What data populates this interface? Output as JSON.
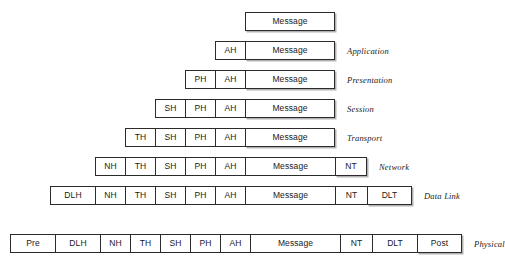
{
  "diagram": {
    "cell_labels": {
      "message": "Message",
      "ah": "AH",
      "ph": "PH",
      "sh": "SH",
      "th": "TH",
      "nh": "NH",
      "nt": "NT",
      "dlh": "DLH",
      "dlt": "DLT",
      "pre": "Pre",
      "post": "Post"
    },
    "rows": [
      {
        "layer_label": "",
        "top": 12,
        "left": 245,
        "cells": [
          {
            "text": "Message",
            "width": 90
          }
        ]
      },
      {
        "layer_label": "Application",
        "top": 41,
        "left": 215,
        "cells": [
          {
            "text": "AH",
            "width": 30
          },
          {
            "text": "Message",
            "width": 90
          }
        ]
      },
      {
        "layer_label": "Presentation",
        "top": 70,
        "left": 185,
        "cells": [
          {
            "text": "PH",
            "width": 30
          },
          {
            "text": "AH",
            "width": 30
          },
          {
            "text": "Message",
            "width": 90
          }
        ]
      },
      {
        "layer_label": "Session",
        "top": 99,
        "left": 155,
        "cells": [
          {
            "text": "SH",
            "width": 30
          },
          {
            "text": "PH",
            "width": 30
          },
          {
            "text": "AH",
            "width": 30
          },
          {
            "text": "Message",
            "width": 90
          }
        ]
      },
      {
        "layer_label": "Transport",
        "top": 128,
        "left": 125,
        "cells": [
          {
            "text": "TH",
            "width": 30
          },
          {
            "text": "SH",
            "width": 30
          },
          {
            "text": "PH",
            "width": 30
          },
          {
            "text": "AH",
            "width": 30
          },
          {
            "text": "Message",
            "width": 90
          }
        ]
      },
      {
        "layer_label": "Network",
        "top": 157,
        "left": 95,
        "cells": [
          {
            "text": "NH",
            "width": 30
          },
          {
            "text": "TH",
            "width": 30
          },
          {
            "text": "SH",
            "width": 30
          },
          {
            "text": "PH",
            "width": 30
          },
          {
            "text": "AH",
            "width": 30
          },
          {
            "text": "Message",
            "width": 90
          },
          {
            "text": "NT",
            "width": 32
          }
        ]
      },
      {
        "layer_label": "Data Link",
        "top": 186,
        "left": 50,
        "cells": [
          {
            "text": "DLH",
            "width": 45
          },
          {
            "text": "NH",
            "width": 30
          },
          {
            "text": "TH",
            "width": 30
          },
          {
            "text": "SH",
            "width": 30
          },
          {
            "text": "PH",
            "width": 30
          },
          {
            "text": "AH",
            "width": 30
          },
          {
            "text": "Message",
            "width": 90
          },
          {
            "text": "NT",
            "width": 32
          },
          {
            "text": "DLT",
            "width": 45
          }
        ]
      },
      {
        "layer_label": "Physical",
        "top": 234,
        "left": 10,
        "cells": [
          {
            "text": "Pre",
            "width": 45
          },
          {
            "text": "DLH",
            "width": 45
          },
          {
            "text": "NH",
            "width": 30
          },
          {
            "text": "TH",
            "width": 30
          },
          {
            "text": "SH",
            "width": 30
          },
          {
            "text": "PH",
            "width": 30
          },
          {
            "text": "AH",
            "width": 30
          },
          {
            "text": "Message",
            "width": 90
          },
          {
            "text": "NT",
            "width": 32
          },
          {
            "text": "DLT",
            "width": 45
          },
          {
            "text": "Post",
            "width": 45
          }
        ]
      }
    ],
    "label_gap": 12,
    "colors": {
      "border": "#2b2b2b",
      "text": "#1a1a1a",
      "background": "#ffffff"
    }
  }
}
